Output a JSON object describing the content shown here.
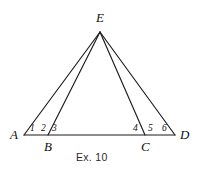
{
  "figure": {
    "caption": "Ex. 10",
    "background_color": "#ffffff",
    "stroke_color": "#1a1a1a",
    "text_color": "#0f0f0f",
    "type": "geometry-diagram"
  },
  "vertices": {
    "A": {
      "label": "A",
      "x": 24,
      "y": 135
    },
    "B": {
      "label": "B",
      "x": 48,
      "y": 135
    },
    "C": {
      "label": "C",
      "x": 145,
      "y": 135
    },
    "D": {
      "label": "D",
      "x": 175,
      "y": 135
    },
    "E": {
      "label": "E",
      "x": 100,
      "y": 32
    }
  },
  "vertex_labels": [
    {
      "name": "vertex-label-E",
      "text": "E",
      "x": 100,
      "y": 17
    },
    {
      "name": "vertex-label-A",
      "text": "A",
      "x": 14,
      "y": 135
    },
    {
      "name": "vertex-label-B",
      "text": "B",
      "x": 48,
      "y": 147
    },
    {
      "name": "vertex-label-C",
      "text": "C",
      "x": 145,
      "y": 147
    },
    {
      "name": "vertex-label-D",
      "text": "D",
      "x": 184,
      "y": 135
    }
  ],
  "angle_labels": [
    {
      "name": "angle-label-1",
      "text": "1",
      "x": 32,
      "y": 130
    },
    {
      "name": "angle-label-2",
      "text": "2",
      "x": 43,
      "y": 130
    },
    {
      "name": "angle-label-3",
      "text": "3",
      "x": 54,
      "y": 130
    },
    {
      "name": "angle-label-4",
      "text": "4",
      "x": 135,
      "y": 130
    },
    {
      "name": "angle-label-5",
      "text": "5",
      "x": 150,
      "y": 130
    },
    {
      "name": "angle-label-6",
      "text": "6",
      "x": 164,
      "y": 130
    }
  ],
  "segments": [
    {
      "name": "segment-base-AD",
      "x1": 24,
      "y1": 135,
      "x2": 175,
      "y2": 135
    },
    {
      "name": "segment-EA",
      "x1": 100,
      "y1": 32,
      "x2": 24,
      "y2": 135
    },
    {
      "name": "segment-EB",
      "x1": 100,
      "y1": 32,
      "x2": 48,
      "y2": 135
    },
    {
      "name": "segment-EC",
      "x1": 100,
      "y1": 32,
      "x2": 145,
      "y2": 135
    },
    {
      "name": "segment-ED",
      "x1": 100,
      "y1": 32,
      "x2": 175,
      "y2": 135
    }
  ],
  "caption_position": {
    "x": 99,
    "y": 158
  }
}
